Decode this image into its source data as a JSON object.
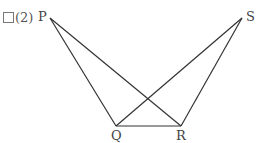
{
  "problem": {
    "number_label": "(2)"
  },
  "diagram": {
    "points": {
      "P": {
        "label": "P",
        "x": 50,
        "y": 18
      },
      "S": {
        "label": "S",
        "x": 242,
        "y": 18
      },
      "Q": {
        "label": "Q",
        "x": 116,
        "y": 126
      },
      "R": {
        "label": "R",
        "x": 181,
        "y": 126
      }
    },
    "segments": [
      "PQ",
      "PR",
      "SQ",
      "SR",
      "QR"
    ],
    "line_color": "#333333"
  }
}
